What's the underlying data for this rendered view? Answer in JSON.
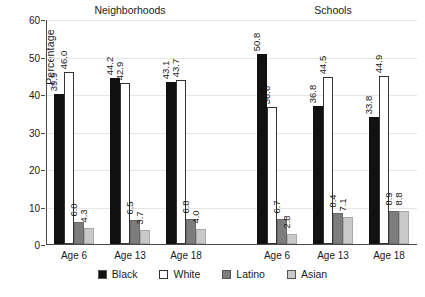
{
  "chart_data": {
    "type": "bar",
    "title": "",
    "xlabel": "",
    "ylabel": "Percentage",
    "ylim": [
      0,
      60
    ],
    "yticks": [
      0,
      10,
      20,
      30,
      40,
      50,
      60
    ],
    "grid": true,
    "legend_position": "bottom",
    "panels": [
      {
        "name": "Neighborhoods",
        "categories": [
          "Age 6",
          "Age 13",
          "Age 18"
        ],
        "series": [
          {
            "name": "Black",
            "color": "#111111",
            "values": [
              39.9,
              44.2,
              43.1
            ]
          },
          {
            "name": "White",
            "color": "#ffffff",
            "values": [
              46.0,
              42.9,
              43.7
            ]
          },
          {
            "name": "Latino",
            "color": "#7d7d7d",
            "values": [
              6.0,
              6.5,
              6.8
            ]
          },
          {
            "name": "Asian",
            "color": "#c9c9c9",
            "values": [
              4.3,
              3.7,
              4.0
            ]
          }
        ]
      },
      {
        "name": "Schools",
        "categories": [
          "Age 6",
          "Age 13",
          "Age 18"
        ],
        "series": [
          {
            "name": "Black",
            "color": "#111111",
            "values": [
              50.8,
              36.8,
              33.8
            ]
          },
          {
            "name": "White",
            "color": "#ffffff",
            "values": [
              36.6,
              44.5,
              44.9
            ]
          },
          {
            "name": "Latino",
            "color": "#7d7d7d",
            "values": [
              6.7,
              8.4,
              8.9
            ]
          },
          {
            "name": "Asian",
            "color": "#c9c9c9",
            "values": [
              2.8,
              7.1,
              8.8
            ]
          }
        ]
      }
    ],
    "legend": [
      {
        "label": "Black",
        "color": "#111111"
      },
      {
        "label": "White",
        "color": "#ffffff"
      },
      {
        "label": "Latino",
        "color": "#7d7d7d"
      },
      {
        "label": "Asian",
        "color": "#c9c9c9"
      }
    ]
  }
}
